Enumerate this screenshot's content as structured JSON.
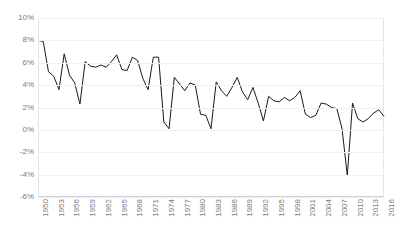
{
  "chart_data": {
    "type": "line",
    "title": "",
    "xlabel": "",
    "ylabel": "",
    "grid": true,
    "legend": false,
    "ylim": [
      -6,
      10
    ],
    "ytick_labels": [
      "10%",
      "8%",
      "6%",
      "4%",
      "2%",
      "0%",
      "-2%",
      "-4%",
      "-6%"
    ],
    "ytick_values": [
      10,
      8,
      6,
      4,
      2,
      0,
      -2,
      -4,
      -6
    ],
    "xtick_labels": [
      "1950",
      "1953",
      "1956",
      "1959",
      "1962",
      "1965",
      "1968",
      "1971",
      "1974",
      "1977",
      "1980",
      "1983",
      "1986",
      "1989",
      "1992",
      "1995",
      "1998",
      "2001",
      "2004",
      "2007",
      "2010",
      "2013",
      "2016"
    ],
    "xlim": [
      1950,
      2016
    ],
    "line_color": "#1a1a1a",
    "line_width": 1,
    "series": [
      {
        "name": "Growth rate",
        "x": [
          1950,
          1951,
          1952,
          1953,
          1954,
          1955,
          1956,
          1957,
          1958,
          1959,
          1960,
          1961,
          1962,
          1963,
          1964,
          1965,
          1966,
          1967,
          1968,
          1969,
          1970,
          1971,
          1972,
          1973,
          1974,
          1975,
          1976,
          1977,
          1978,
          1979,
          1980,
          1981,
          1982,
          1983,
          1984,
          1985,
          1986,
          1987,
          1988,
          1989,
          1990,
          1991,
          1992,
          1993,
          1994,
          1995,
          1996,
          1997,
          1998,
          1999,
          2000,
          2001,
          2002,
          2003,
          2004,
          2005,
          2006,
          2007,
          2008,
          2009,
          2010,
          2011,
          2012,
          2013,
          2014,
          2015,
          2016
        ],
        "values": [
          8.0,
          7.9,
          5.2,
          4.8,
          3.6,
          6.8,
          4.9,
          4.2,
          2.3,
          6.1,
          5.7,
          5.6,
          5.8,
          5.6,
          6.1,
          6.7,
          5.4,
          5.3,
          6.5,
          6.2,
          4.6,
          3.6,
          6.5,
          6.5,
          0.7,
          0.1,
          4.7,
          4.1,
          3.5,
          4.2,
          4.0,
          1.4,
          1.3,
          0.1,
          4.3,
          3.5,
          3.0,
          3.8,
          4.7,
          3.4,
          2.7,
          3.8,
          2.4,
          0.8,
          3.0,
          2.6,
          2.5,
          2.9,
          2.6,
          2.9,
          3.5,
          1.4,
          1.1,
          1.3,
          2.4,
          2.3,
          2.0,
          1.9,
          0.1,
          -4.1,
          2.4,
          1.0,
          0.7,
          1.0,
          1.5,
          1.8,
          1.2
        ]
      }
    ]
  }
}
